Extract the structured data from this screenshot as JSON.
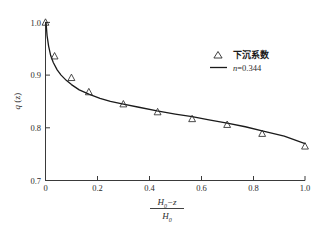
{
  "chart_data": {
    "type": "scatter",
    "title": "",
    "subtitle": "",
    "xlabel_numerator": "H₀−z",
    "xlabel_denominator": "H₀",
    "xlabel_plain": "(H0-z)/H0",
    "ylabel": "q (z)",
    "ylabel_plain": "q(z)",
    "xlim": [
      0,
      1.0
    ],
    "ylim": [
      0.7,
      1.0
    ],
    "xticks": [
      "0",
      "0.2",
      "0.4",
      "0.6",
      "0.8",
      "1.0"
    ],
    "xtick_values": [
      0,
      0.2,
      0.4,
      0.6,
      0.8,
      1.0
    ],
    "yticks": [
      "0.7",
      "0.8",
      "0.9",
      "1.0"
    ],
    "ytick_values": [
      0.7,
      0.8,
      0.9,
      1.0
    ],
    "grid": false,
    "legend_position": "upper-right",
    "series": [
      {
        "name": "下沉系数",
        "type": "scatter",
        "marker": "triangle-up-open",
        "color": "#2b2b2b",
        "x": [
          0.0,
          0.035,
          0.1,
          0.167,
          0.3,
          0.432,
          0.565,
          0.7,
          0.835,
          1.0
        ],
        "y": [
          1.0,
          0.936,
          0.895,
          0.868,
          0.845,
          0.83,
          0.817,
          0.806,
          0.789,
          0.765
        ]
      },
      {
        "name": "n=0.344",
        "type": "line",
        "color": "#1a1a1a",
        "exponent": 0.344,
        "x": [
          0.002,
          0.006,
          0.012,
          0.02,
          0.03,
          0.045,
          0.06,
          0.08,
          0.1,
          0.13,
          0.167,
          0.21,
          0.25,
          0.3,
          0.36,
          0.43,
          0.5,
          0.565,
          0.63,
          0.7,
          0.77,
          0.835,
          0.92,
          1.0
        ],
        "y": [
          1.0,
          0.975,
          0.955,
          0.937,
          0.924,
          0.91,
          0.9,
          0.89,
          0.882,
          0.872,
          0.864,
          0.856,
          0.85,
          0.845,
          0.839,
          0.832,
          0.826,
          0.821,
          0.815,
          0.809,
          0.802,
          0.794,
          0.784,
          0.77
        ]
      }
    ]
  },
  "legend": {
    "entries": [
      {
        "label": "下沉系数",
        "marker": "triangle-up-open"
      },
      {
        "label_prefix": "n",
        "label_suffix": "=0.344",
        "marker": "line"
      }
    ]
  },
  "axes": {
    "x": {
      "ticks": [
        "0",
        "0.2",
        "0.4",
        "0.6",
        "0.8",
        "1.0"
      ],
      "label_numerator_base": "H",
      "label_numerator_sub": "0",
      "label_numerator_rest": "−z",
      "label_denominator_base": "H",
      "label_denominator_sub": "0"
    },
    "y": {
      "ticks": [
        "0.7",
        "0.8",
        "0.9",
        "1.0"
      ],
      "label_base": "q",
      "label_arg": " (z)"
    }
  },
  "colors": {
    "axis": "#3a3a3a",
    "curve": "#1a1a1a",
    "marker": "#2b2b2b",
    "text": "#1a1a1a",
    "background": "#ffffff"
  }
}
